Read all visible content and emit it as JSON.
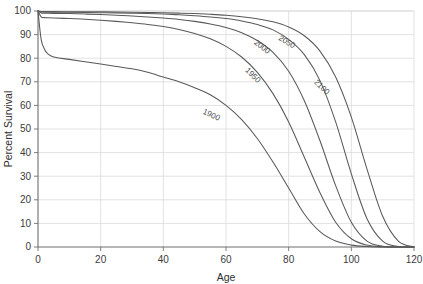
{
  "chart_data": {
    "type": "line",
    "title": "",
    "xlabel": "Age",
    "ylabel": "Percent Survival",
    "xlim": [
      0,
      120
    ],
    "ylim": [
      0,
      100
    ],
    "grid": true,
    "legend_position": "inline-curve-labels",
    "xticks": [
      0,
      20,
      40,
      60,
      80,
      100,
      120
    ],
    "xticklabels": [
      "0",
      "20",
      "40",
      "60",
      "80",
      "100",
      "120"
    ],
    "yticks": [
      0,
      10,
      20,
      30,
      40,
      50,
      60,
      70,
      80,
      90,
      100
    ],
    "yticklabels": [
      "0",
      "10",
      "20",
      "30",
      "40",
      "50",
      "60",
      "70",
      "80",
      "90",
      "100"
    ],
    "x": [
      0,
      1,
      2,
      3,
      5,
      10,
      15,
      20,
      25,
      30,
      35,
      40,
      45,
      50,
      55,
      60,
      65,
      70,
      75,
      80,
      85,
      90,
      95,
      100,
      105,
      110,
      115,
      120
    ],
    "series": [
      {
        "name": "1900",
        "label": "1900",
        "color": "#595959",
        "label_x": 55,
        "label_y": 55,
        "values": [
          100,
          88,
          84,
          82,
          80.5,
          79.5,
          78.5,
          77.5,
          76.5,
          75.5,
          74,
          72,
          70,
          67.5,
          64.5,
          60,
          54,
          46,
          36,
          25,
          14,
          6.5,
          2.5,
          0.8,
          0.2,
          0,
          0,
          0
        ]
      },
      {
        "name": "1950",
        "label": "1950",
        "color": "#595959",
        "label_x": 68,
        "label_y": 72,
        "values": [
          100,
          97.5,
          97.2,
          97.1,
          97,
          96.8,
          96.5,
          96.1,
          95.6,
          95,
          94.3,
          93.4,
          92.2,
          90.5,
          88.2,
          85,
          80.5,
          74,
          65,
          53,
          38,
          23,
          10.5,
          3.5,
          0.8,
          0.1,
          0,
          0
        ]
      },
      {
        "name": "2000",
        "label": "2000",
        "color": "#595959",
        "label_x": 71,
        "label_y": 84,
        "values": [
          100,
          99.2,
          99.1,
          99.05,
          99,
          98.9,
          98.7,
          98.5,
          98.2,
          97.9,
          97.5,
          97,
          96.4,
          95.6,
          94.5,
          93,
          90.8,
          87.5,
          82.5,
          74.5,
          62,
          45,
          26,
          10.5,
          2.5,
          0.3,
          0,
          0
        ]
      },
      {
        "name": "2050",
        "label": "2050",
        "color": "#595959",
        "label_x": 79,
        "label_y": 86,
        "values": [
          100,
          99.6,
          99.55,
          99.5,
          99.5,
          99.45,
          99.4,
          99.3,
          99.2,
          99.05,
          98.9,
          98.7,
          98.4,
          98,
          97.5,
          96.8,
          95.8,
          94.3,
          92,
          88,
          81.5,
          70.5,
          53,
          31,
          12,
          2.5,
          0.2,
          0
        ]
      },
      {
        "name": "2100",
        "label": "2100",
        "color": "#595959",
        "label_x": 90,
        "label_y": 67,
        "values": [
          100,
          99.8,
          99.78,
          99.75,
          99.74,
          99.7,
          99.68,
          99.65,
          99.6,
          99.5,
          99.4,
          99.3,
          99.1,
          98.9,
          98.6,
          98.2,
          97.6,
          96.7,
          95.4,
          93.2,
          89.5,
          83,
          72,
          55,
          33,
          13,
          2.5,
          0
        ]
      }
    ]
  },
  "axes": {
    "x_title": "Age",
    "y_title": "Percent Survival"
  }
}
